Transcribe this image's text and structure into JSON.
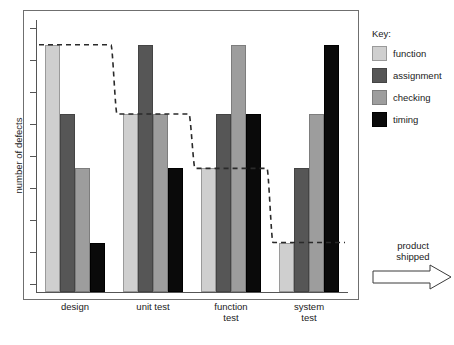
{
  "chart_data": {
    "type": "bar",
    "title": "",
    "subtitle": "",
    "xlabel": "",
    "ylabel": "number of defects",
    "categories": [
      "design",
      "unit test",
      "function test",
      "system test"
    ],
    "category_lines": [
      [
        "design"
      ],
      [
        "unit test"
      ],
      [
        "function",
        "test"
      ],
      [
        "system",
        "test"
      ]
    ],
    "series": [
      {
        "name": "function",
        "color": "#cfcfcf",
        "values": [
          100,
          72,
          50,
          20
        ]
      },
      {
        "name": "assignment",
        "color": "#565656",
        "values": [
          72,
          100,
          72,
          50
        ]
      },
      {
        "name": "checking",
        "color": "#9d9d9d",
        "values": [
          50,
          72,
          100,
          72
        ]
      },
      {
        "name": "timing",
        "color": "#0a0a0a",
        "values": [
          20,
          50,
          72,
          100
        ]
      }
    ],
    "overlay_line": {
      "name": "function defect trend",
      "style": "dashed",
      "color": "#2a2a2a",
      "values": [
        100,
        72,
        50,
        20
      ]
    },
    "ylim": [
      0,
      110
    ],
    "y_tick_count": 9,
    "y_tick_labels": [],
    "grid": false,
    "legend_position": "right",
    "legend_title": "Key:",
    "annotations": [
      {
        "name": "product-shipped",
        "lines": [
          "product",
          "shipped"
        ],
        "marker": "right-arrow"
      }
    ]
  },
  "legend": {
    "title": "Key:",
    "entries": [
      {
        "label": "function",
        "swatch": "swatch-function"
      },
      {
        "label": "assignment",
        "swatch": "swatch-assignment"
      },
      {
        "label": "checking",
        "swatch": "swatch-checking"
      },
      {
        "label": "timing",
        "swatch": "swatch-timing"
      }
    ]
  },
  "annotation": {
    "line1": "product",
    "line2": "shipped",
    "icon": "right-arrow-icon"
  },
  "axes": {
    "y_title": "number of defects"
  }
}
